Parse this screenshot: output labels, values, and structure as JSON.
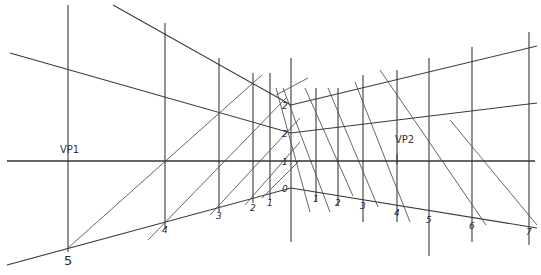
{
  "diagram": {
    "type": "two-point perspective construction sketch",
    "style": "hand-drawn pencil lines on white",
    "colors": {
      "background": "#ffffff",
      "line": "#3a3a3a",
      "faint_line": "#9a9a9a",
      "label": "#2a2a2a"
    },
    "vanishing_points": [
      {
        "label": "VP1",
        "x": 68,
        "y": 161
      },
      {
        "label": "VP2",
        "x": 397,
        "y": 161
      }
    ],
    "horizon": {
      "y": 161,
      "x1": 7,
      "x2": 535
    },
    "center_vertical": {
      "x": 291,
      "y1": 58,
      "y2": 242,
      "marks": [
        {
          "label": "2",
          "y": 105
        },
        {
          "label": "2",
          "y": 133
        },
        {
          "label": "1",
          "y": 161
        },
        {
          "label": "0",
          "y": 188
        }
      ]
    },
    "left_ground_marks": [
      {
        "label": "5",
        "x": 68,
        "y": 248
      },
      {
        "label": "4",
        "x": 165,
        "y": 222
      },
      {
        "label": "3",
        "x": 219,
        "y": 208
      },
      {
        "label": "2",
        "x": 253,
        "y": 200
      },
      {
        "label": "1",
        "x": 270,
        "y": 195
      }
    ],
    "right_ground_marks": [
      {
        "label": "1",
        "x": 316,
        "y": 191
      },
      {
        "label": "2",
        "x": 338,
        "y": 195
      },
      {
        "label": "3",
        "x": 363,
        "y": 198
      },
      {
        "label": "4",
        "x": 397,
        "y": 205
      },
      {
        "label": "5",
        "x": 429,
        "y": 212
      },
      {
        "label": "6",
        "x": 472,
        "y": 218
      },
      {
        "label": "7",
        "x": 529,
        "y": 224
      }
    ]
  },
  "lines": {
    "verticals": [
      {
        "x": 68,
        "y1": 5,
        "y2": 252
      },
      {
        "x": 165,
        "y1": 23,
        "y2": 228
      },
      {
        "x": 219,
        "y1": 58,
        "y2": 212
      },
      {
        "x": 253,
        "y1": 73,
        "y2": 203
      },
      {
        "x": 270,
        "y1": 73,
        "y2": 200
      },
      {
        "x": 316,
        "y1": 88,
        "y2": 202
      },
      {
        "x": 338,
        "y1": 88,
        "y2": 205
      },
      {
        "x": 363,
        "y1": 75,
        "y2": 222
      },
      {
        "x": 397,
        "y1": 70,
        "y2": 222
      },
      {
        "x": 429,
        "y1": 58,
        "y2": 256
      },
      {
        "x": 472,
        "y1": 47,
        "y2": 242
      },
      {
        "x": 529,
        "y1": 32,
        "y2": 245
      }
    ],
    "ground_left": {
      "x1": 7,
      "y1": 265,
      "x2": 291,
      "y2": 188
    },
    "ground_right": {
      "x1": 291,
      "y1": 188,
      "x2": 537,
      "y2": 228
    },
    "top_left": {
      "x1": 113,
      "y1": 5,
      "x2": 291,
      "y2": 105
    },
    "top_right": {
      "x1": 291,
      "y1": 105,
      "x2": 537,
      "y2": 46
    },
    "mid_left": {
      "x1": 10,
      "y1": 53,
      "x2": 291,
      "y2": 133
    },
    "mid_right": {
      "x1": 291,
      "y1": 133,
      "x2": 537,
      "y2": 103
    },
    "diag_up": [
      {
        "x1": 68,
        "y1": 248,
        "x2": 262,
        "y2": 75
      },
      {
        "x1": 148,
        "y1": 240,
        "x2": 286,
        "y2": 98
      },
      {
        "x1": 210,
        "y1": 215,
        "x2": 300,
        "y2": 118
      },
      {
        "x1": 245,
        "y1": 205,
        "x2": 300,
        "y2": 142
      },
      {
        "x1": 262,
        "y1": 198,
        "x2": 300,
        "y2": 160
      },
      {
        "x1": 276,
        "y1": 95,
        "x2": 308,
        "y2": 78
      }
    ],
    "diag_down": [
      {
        "x1": 276,
        "y1": 88,
        "x2": 310,
        "y2": 212
      },
      {
        "x1": 283,
        "y1": 88,
        "x2": 330,
        "y2": 212
      },
      {
        "x1": 305,
        "y1": 88,
        "x2": 353,
        "y2": 196
      },
      {
        "x1": 328,
        "y1": 88,
        "x2": 378,
        "y2": 207
      },
      {
        "x1": 355,
        "y1": 82,
        "x2": 410,
        "y2": 222
      },
      {
        "x1": 380,
        "y1": 70,
        "x2": 486,
        "y2": 225
      },
      {
        "x1": 450,
        "y1": 120,
        "x2": 537,
        "y2": 225
      }
    ]
  }
}
